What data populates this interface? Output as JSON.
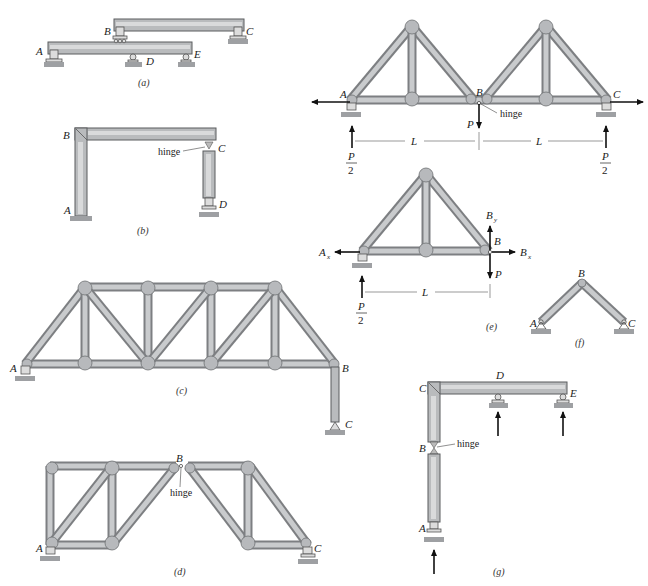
{
  "figure": {
    "subfigures": [
      {
        "id": "a",
        "caption": "(a)",
        "labels": [
          "A",
          "B",
          "C",
          "D",
          "E"
        ]
      },
      {
        "id": "b",
        "caption": "(b)",
        "labels": [
          "A",
          "B",
          "C",
          "D"
        ],
        "notes": [
          "hinge"
        ]
      },
      {
        "id": "c",
        "caption": "(c)",
        "labels": [
          "A",
          "B",
          "C"
        ]
      },
      {
        "id": "d",
        "caption": "(d)",
        "labels": [
          "A",
          "B",
          "C"
        ],
        "notes": [
          "hinge"
        ]
      },
      {
        "id": "e",
        "caption": "(e)",
        "labels": [
          "A",
          "B",
          "C"
        ],
        "notes": [
          "hinge"
        ],
        "loads": [
          "P",
          "P/2",
          "P/2"
        ],
        "dims": [
          "L",
          "L"
        ]
      },
      {
        "id": "e2",
        "caption": "(e)",
        "labels": [
          "Ax",
          "B",
          "By",
          "Bx"
        ],
        "loads": [
          "P",
          "P/2"
        ],
        "dims": [
          "L"
        ]
      },
      {
        "id": "f",
        "caption": "(f)",
        "labels": [
          "A",
          "B",
          "C"
        ]
      },
      {
        "id": "g",
        "caption": "(g)",
        "labels": [
          "A",
          "B",
          "C",
          "D",
          "E"
        ],
        "notes": [
          "hinge"
        ]
      }
    ]
  },
  "a": {
    "A": "A",
    "B": "B",
    "C": "C",
    "D": "D",
    "E": "E",
    "caption": "(a)"
  },
  "b": {
    "A": "A",
    "B": "B",
    "C": "C",
    "D": "D",
    "hinge": "hinge",
    "caption": "(b)"
  },
  "c": {
    "A": "A",
    "B": "B",
    "C": "C",
    "caption": "(c)"
  },
  "d": {
    "A": "A",
    "B": "B",
    "C": "C",
    "hinge": "hinge",
    "caption": "(d)"
  },
  "e": {
    "A": "A",
    "B": "B",
    "C": "C",
    "hinge": "hinge",
    "P": "P",
    "P_num": "P",
    "P_den": "2",
    "L": "L"
  },
  "e2": {
    "Ax": "A",
    "Ax_sub": "x",
    "B": "B",
    "By": "B",
    "By_sub": "y",
    "Bx": "B",
    "Bx_sub": "x",
    "P": "P",
    "P_num": "P",
    "P_den": "2",
    "L": "L",
    "caption": "(e)"
  },
  "f": {
    "A": "A",
    "B": "B",
    "C": "C",
    "caption": "(f)"
  },
  "g": {
    "A": "A",
    "B": "B",
    "C": "C",
    "D": "D",
    "E": "E",
    "hinge": "hinge",
    "caption": "(g)"
  }
}
